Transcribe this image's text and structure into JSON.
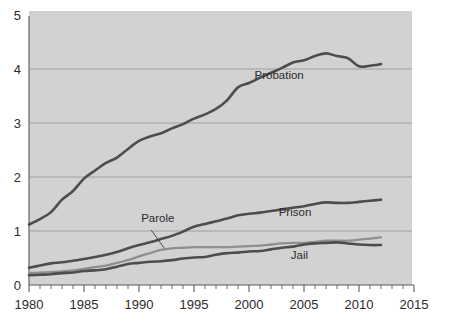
{
  "chart_data": {
    "type": "line",
    "title": "",
    "subtitle": "",
    "xlabel": "",
    "ylabel": "",
    "xlim": [
      1980,
      2015
    ],
    "ylim": [
      0,
      5
    ],
    "grid": true,
    "legend_position": "inline-annotations",
    "y_ticks": [
      "0",
      "1",
      "2",
      "3",
      "4",
      "5"
    ],
    "y_tick_values": [
      0,
      1,
      2,
      3,
      4,
      5
    ],
    "x_ticks": [
      "1980",
      "1985",
      "1990",
      "1995",
      "2000",
      "2005",
      "2010",
      "2015"
    ],
    "x_tick_values": [
      1980,
      1985,
      1990,
      1995,
      2000,
      2005,
      2010,
      2015
    ],
    "x_minor_tick_step": 1,
    "series": [
      {
        "name": "Probation",
        "color": "#4d4d4d",
        "label": "Probation",
        "label_x": 2000.5,
        "label_y": 3.82,
        "x": [
          1980,
          1981,
          1982,
          1983,
          1984,
          1985,
          1986,
          1987,
          1988,
          1989,
          1990,
          1991,
          1992,
          1993,
          1994,
          1995,
          1996,
          1997,
          1998,
          1999,
          2000,
          2001,
          2002,
          2003,
          2004,
          2005,
          2006,
          2007,
          2008,
          2009,
          2010,
          2011,
          2012
        ],
        "values": [
          1.12,
          1.22,
          1.35,
          1.58,
          1.74,
          1.97,
          2.12,
          2.26,
          2.36,
          2.52,
          2.67,
          2.75,
          2.81,
          2.9,
          2.98,
          3.08,
          3.16,
          3.26,
          3.42,
          3.66,
          3.74,
          3.84,
          3.93,
          4.02,
          4.12,
          4.16,
          4.24,
          4.29,
          4.24,
          4.2,
          4.05,
          4.06,
          4.09
        ],
        "start_value": 1.12,
        "peak_year": 2007,
        "peak_value": 4.29,
        "end_value": 4.09
      },
      {
        "name": "Prison",
        "color": "#4d4d4d",
        "label": "Prison",
        "label_x": 2002.7,
        "label_y": 1.28,
        "x": [
          1980,
          1981,
          1982,
          1983,
          1984,
          1985,
          1986,
          1987,
          1988,
          1989,
          1990,
          1991,
          1992,
          1993,
          1994,
          1995,
          1996,
          1997,
          1998,
          1999,
          2000,
          2001,
          2002,
          2003,
          2004,
          2005,
          2006,
          2007,
          2008,
          2009,
          2010,
          2011,
          2012
        ],
        "values": [
          0.32,
          0.36,
          0.4,
          0.42,
          0.45,
          0.48,
          0.52,
          0.56,
          0.61,
          0.68,
          0.74,
          0.79,
          0.85,
          0.91,
          0.99,
          1.08,
          1.13,
          1.18,
          1.23,
          1.29,
          1.32,
          1.34,
          1.37,
          1.4,
          1.43,
          1.46,
          1.5,
          1.53,
          1.52,
          1.52,
          1.54,
          1.56,
          1.58
        ],
        "start_value": 0.32,
        "end_value": 1.58
      },
      {
        "name": "Parole",
        "color": "#8f8f8f",
        "label": "Parole",
        "label_x": 1990.2,
        "label_y": 1.17,
        "leader_from_x": 1991.1,
        "leader_from_y": 1.02,
        "leader_to_x": 1992.3,
        "leader_to_y": 0.68,
        "x": [
          1980,
          1981,
          1982,
          1983,
          1984,
          1985,
          1986,
          1987,
          1988,
          1989,
          1990,
          1991,
          1992,
          1993,
          1994,
          1995,
          1996,
          1997,
          1998,
          1999,
          2000,
          2001,
          2002,
          2003,
          2004,
          2005,
          2006,
          2007,
          2008,
          2009,
          2010,
          2011,
          2012
        ],
        "values": [
          0.22,
          0.23,
          0.24,
          0.25,
          0.27,
          0.3,
          0.33,
          0.36,
          0.41,
          0.46,
          0.53,
          0.59,
          0.65,
          0.68,
          0.69,
          0.7,
          0.7,
          0.7,
          0.7,
          0.71,
          0.72,
          0.73,
          0.75,
          0.77,
          0.78,
          0.78,
          0.8,
          0.82,
          0.82,
          0.82,
          0.84,
          0.86,
          0.88
        ],
        "start_value": 0.22,
        "end_value": 0.88
      },
      {
        "name": "Jail",
        "color": "#4d4d4d",
        "label": "Jail",
        "label_x": 2003.8,
        "label_y": 0.48,
        "x": [
          1980,
          1981,
          1982,
          1983,
          1984,
          1985,
          1986,
          1987,
          1988,
          1989,
          1990,
          1991,
          1992,
          1993,
          1994,
          1995,
          1996,
          1997,
          1998,
          1999,
          2000,
          2001,
          2002,
          2003,
          2004,
          2005,
          2006,
          2007,
          2008,
          2009,
          2010,
          2011,
          2012
        ],
        "values": [
          0.18,
          0.19,
          0.2,
          0.22,
          0.23,
          0.26,
          0.27,
          0.29,
          0.34,
          0.39,
          0.41,
          0.43,
          0.44,
          0.46,
          0.49,
          0.51,
          0.52,
          0.56,
          0.59,
          0.6,
          0.62,
          0.63,
          0.66,
          0.69,
          0.71,
          0.75,
          0.77,
          0.78,
          0.79,
          0.77,
          0.75,
          0.74,
          0.74
        ],
        "start_value": 0.18,
        "end_value": 0.74
      }
    ]
  },
  "plot": {
    "background_color": "#d2d2d2",
    "gridline_color": "#9a9a9a",
    "axis_color": "#5a5a5a",
    "page_background": "#ffffff"
  }
}
